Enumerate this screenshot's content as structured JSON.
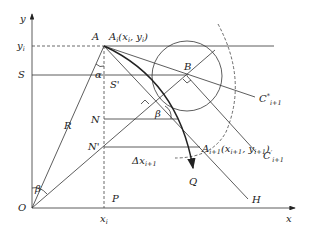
{
  "diagram": {
    "axes": {
      "x_label": "x",
      "y_label": "y",
      "origin_label": "O"
    },
    "labels": {
      "y_i": "y",
      "y_i_sub": "i",
      "S": "S",
      "S_prime": "S'",
      "R": "R",
      "A": "A",
      "A_i": "A",
      "A_i_sub": "i",
      "A_i_coords_open": "(x",
      "A_i_coords_xsub": "i",
      "A_i_coords_mid": ", y",
      "A_i_coords_ysub": "i",
      "A_i_coords_close": ")",
      "alpha": "α",
      "beta_origin": "β",
      "beta_mid": "β",
      "B": "B",
      "N": "N",
      "N_prime": "N'",
      "delta_x": "Δx",
      "delta_x_sub": "i+1",
      "A_next": "A",
      "A_next_sub": "i+1",
      "A_next_coords_open": "(x",
      "A_next_coords_xsub": "i+1",
      "A_next_coords_mid": ", y",
      "A_next_coords_ysub": "i+1",
      "A_next_coords_close": ")",
      "C_star": "C",
      "C_star_sup": "*",
      "C_star_sub": "i+1",
      "C_prime": "C",
      "C_prime_sup": "′",
      "C_prime_sub": "i+1",
      "Q": "Q",
      "H": "H",
      "P": "P",
      "x_i": "x",
      "x_i_sub": "i"
    }
  }
}
